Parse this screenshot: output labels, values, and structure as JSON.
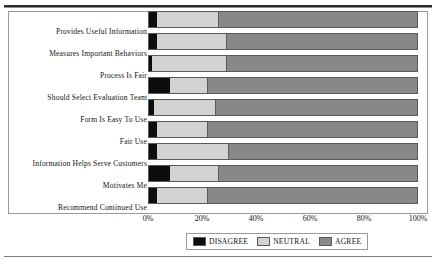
{
  "chart_data": {
    "type": "bar",
    "orientation": "horizontal",
    "stacked": true,
    "stack_mode": "percent",
    "title": "",
    "subtitle": "",
    "xlabel": "",
    "ylabel": "",
    "xlim": [
      0,
      100
    ],
    "xticks": [
      0,
      20,
      40,
      60,
      80,
      100
    ],
    "xtick_labels": [
      "0%",
      "20%",
      "40%",
      "60%",
      "80%",
      "100%"
    ],
    "grid": false,
    "legend_position": "bottom-center",
    "categories": [
      "Provides Useful Information",
      "Measures Important Behaviors",
      "Process Is Fair",
      "Should Select Evaluation Team",
      "Form Is Easy To Use",
      "Fair Use",
      "Information Helps Serve Customers",
      "Motivates Me",
      "Recommend Continued Use"
    ],
    "series": [
      {
        "name": "DISAGREE",
        "color": "#0d0d0d",
        "values": [
          3,
          3,
          1,
          8,
          2,
          3,
          3,
          8,
          3
        ]
      },
      {
        "name": "NEUTRAL",
        "color": "#d2d2d2",
        "values": [
          23,
          26,
          28,
          14,
          23,
          19,
          27,
          18,
          19
        ]
      },
      {
        "name": "AGREE",
        "color": "#888888",
        "values": [
          74,
          71,
          71,
          78,
          75,
          78,
          70,
          74,
          78
        ]
      }
    ]
  },
  "legend": {
    "items": [
      {
        "label": "DISAGREE",
        "color": "#0d0d0d"
      },
      {
        "label": "NEUTRAL",
        "color": "#d2d2d2"
      },
      {
        "label": "AGREE",
        "color": "#888888"
      }
    ]
  }
}
